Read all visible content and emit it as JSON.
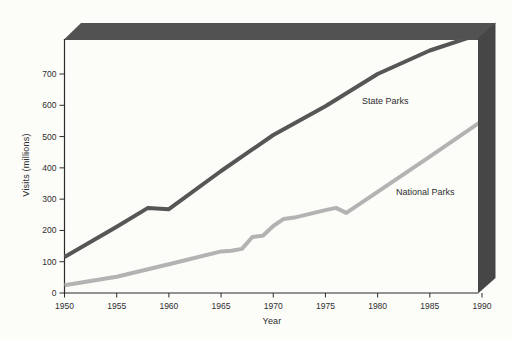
{
  "figure": {
    "background": "#fcfcf9",
    "frame_top_color": "#525252",
    "frame_right_color": "#464646",
    "frame_bevel_color": "#3d3d3d",
    "axis_color": "#2b2b2b",
    "text_color": "#2e2e2e"
  },
  "chart_data": {
    "type": "line",
    "title": "",
    "xlabel": "Year",
    "ylabel": "Visits (millions)",
    "x_ticks": [
      "1950",
      "1955",
      "1960",
      "1965",
      "1970",
      "1975",
      "1980",
      "1985",
      "1990"
    ],
    "y_ticks": [
      "0",
      "100",
      "200",
      "300",
      "400",
      "500",
      "600",
      "700"
    ],
    "xlim": [
      1950,
      1990
    ],
    "ylim": [
      0,
      815
    ],
    "grid": false,
    "legend": "inline-labels",
    "series": [
      {
        "name": "State Parks",
        "color": "#565656",
        "points": [
          [
            1950,
            115
          ],
          [
            1955,
            212
          ],
          [
            1958,
            272
          ],
          [
            1960,
            268
          ],
          [
            1965,
            390
          ],
          [
            1970,
            505
          ],
          [
            1975,
            597
          ],
          [
            1980,
            700
          ],
          [
            1985,
            775
          ],
          [
            1990,
            830
          ]
        ]
      },
      {
        "name": "National Parks",
        "color": "#b3b3b3",
        "points": [
          [
            1950,
            25
          ],
          [
            1955,
            52
          ],
          [
            1960,
            92
          ],
          [
            1965,
            133
          ],
          [
            1966,
            135
          ],
          [
            1967,
            141
          ],
          [
            1968,
            179
          ],
          [
            1969,
            183
          ],
          [
            1970,
            214
          ],
          [
            1971,
            237
          ],
          [
            1972,
            241
          ],
          [
            1973,
            249
          ],
          [
            1974,
            257
          ],
          [
            1975,
            265
          ],
          [
            1976,
            272
          ],
          [
            1977,
            256
          ],
          [
            1980,
            323
          ],
          [
            1985,
            436
          ],
          [
            1990,
            550
          ]
        ]
      }
    ]
  }
}
